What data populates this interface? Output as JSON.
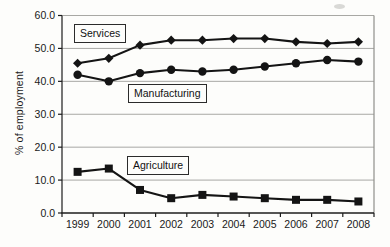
{
  "chart_data": {
    "type": "line",
    "title": "",
    "xlabel": "",
    "ylabel": "% of employment",
    "categories": [
      "1999",
      "2000",
      "2001",
      "2002",
      "2003",
      "2004",
      "2005",
      "2006",
      "2007",
      "2008"
    ],
    "ylim": [
      0,
      60
    ],
    "ytick_labels": [
      "0.0",
      "10.0",
      "20.0",
      "30.0",
      "40.0",
      "50.0",
      "60.0"
    ],
    "ytick_values": [
      0,
      10,
      20,
      30,
      40,
      50,
      60
    ],
    "grid": "horizontal",
    "legend_position": "inline-boxed-labels",
    "series": [
      {
        "name": "Services",
        "marker": "diamond-icon",
        "values": [
          45.5,
          47.0,
          51.0,
          52.5,
          52.5,
          53.0,
          53.0,
          52.0,
          51.5,
          52.0
        ]
      },
      {
        "name": "Manufacturing",
        "marker": "circle-icon",
        "values": [
          42.0,
          40.0,
          42.5,
          43.5,
          43.0,
          43.5,
          44.5,
          45.5,
          46.5,
          46.0
        ]
      },
      {
        "name": "Agriculture",
        "marker": "square-icon",
        "values": [
          12.5,
          13.5,
          7.0,
          4.5,
          5.5,
          5.0,
          4.5,
          4.0,
          4.0,
          3.5
        ]
      }
    ]
  },
  "colors": {
    "series_line": "#141414",
    "marker_fill": "#141414",
    "gridline": "#a8a8a4",
    "plot_border": "#8f8f8b",
    "axis_line": "#1c1c1c",
    "tick_text": "#1a1a1a",
    "background": "#fdfdfb"
  }
}
